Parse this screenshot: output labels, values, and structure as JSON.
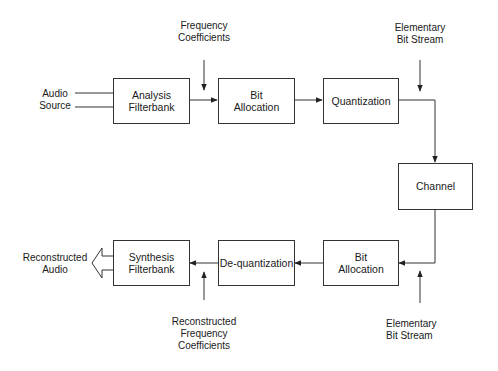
{
  "diagram": {
    "encoder": {
      "input_label": [
        "Audio",
        "Source"
      ],
      "analysis_filterbank": [
        "Analysis",
        "Filterbank"
      ],
      "bit_allocation": [
        "Bit",
        "Allocation"
      ],
      "quantization": [
        "Quantization"
      ],
      "freq_coeff_label": [
        "Frequency",
        "Coefficients"
      ],
      "bitstream_label": [
        "Elementary",
        "Bit Stream"
      ]
    },
    "channel": [
      "Channel"
    ],
    "decoder": {
      "bit_allocation": [
        "Bit",
        "Allocation"
      ],
      "dequantization": [
        "De-quantization"
      ],
      "synthesis_filterbank": [
        "Synthesis",
        "Filterbank"
      ],
      "output_label": [
        "Reconstructed",
        "Audio"
      ],
      "recon_coeff_label": [
        "Reconstructed",
        "Frequency",
        "Coefficients"
      ],
      "bitstream_label": [
        "Elementary",
        "Bit Stream"
      ]
    },
    "colors": {
      "line": "#333333",
      "box_fill": "#ffffff",
      "text": "#1a1a1a"
    }
  }
}
